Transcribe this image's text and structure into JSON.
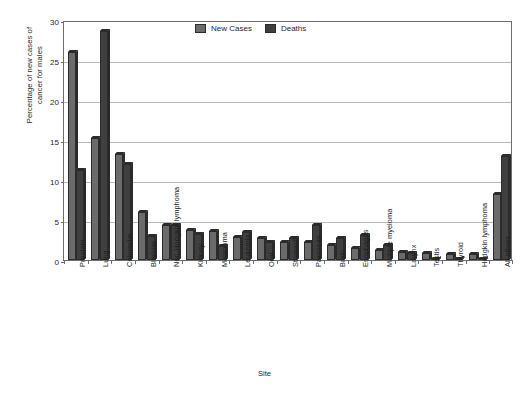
{
  "chart_data": {
    "type": "bar",
    "title": "",
    "xlabel": "Site",
    "ylabel": "Percentage of new cases of\ncancer for males",
    "ylim": [
      0,
      30
    ],
    "yticks": [
      0,
      5,
      10,
      15,
      20,
      25,
      30
    ],
    "grid": true,
    "legend_position": "top-center",
    "categories": [
      "Prostate",
      "Lung",
      "Colorectal",
      "Bladder",
      "Non-Hodgkin lymphoma",
      "Kidney",
      "Melanoma",
      "Leukemia",
      "Oral",
      "Stomach",
      "Pancreas",
      "Brain",
      "Esophagus",
      "Multiple myeloma",
      "Larynx",
      "Testis",
      "Thyroid",
      "Hodgkin lymphoma",
      "All others"
    ],
    "series": [
      {
        "name": "New Cases",
        "color": "#6b6b6b",
        "values": [
          26.0,
          15.3,
          13.3,
          6.0,
          4.4,
          3.8,
          3.6,
          2.9,
          2.8,
          2.3,
          2.3,
          1.9,
          1.5,
          1.2,
          1.0,
          0.9,
          0.8,
          0.7,
          8.3
        ]
      },
      {
        "name": "Deaths",
        "color": "#3f3f3f",
        "values": [
          11.2,
          28.6,
          12.0,
          3.0,
          4.4,
          3.2,
          1.8,
          3.5,
          2.3,
          2.8,
          4.4,
          2.7,
          3.1,
          1.9,
          0.9,
          0.1,
          0.15,
          0.15,
          13.0
        ]
      }
    ]
  },
  "legend": {
    "items": [
      {
        "label": "New Cases",
        "swatch": "new-cases-swatch"
      },
      {
        "label": "Deaths",
        "swatch": "deaths-swatch"
      }
    ]
  },
  "axes": {
    "y_title": "Percentage of new cases of\ncancer for males",
    "x_title": "Site",
    "y_tick_labels": [
      "0",
      "5",
      "10",
      "15",
      "20",
      "25",
      "30"
    ]
  }
}
